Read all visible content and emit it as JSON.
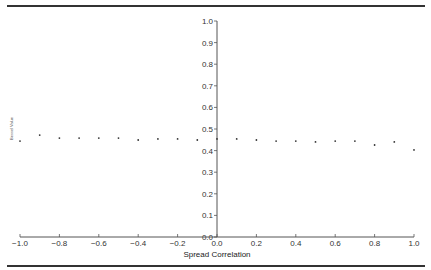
{
  "chart_data": {
    "type": "scatter",
    "title": "",
    "xlabel": "Spread Correlation",
    "ylabel": "Bessel Value",
    "xlim": [
      -1.0,
      1.0
    ],
    "ylim": [
      0.0,
      1.0
    ],
    "xticks": [
      "−1.0",
      "−0.8",
      "−0.6",
      "−0.4",
      "−0.2",
      "0.0",
      "0.2",
      "0.4",
      "0.6",
      "0.8",
      "1.0"
    ],
    "xtick_values": [
      -1.0,
      -0.8,
      -0.6,
      -0.4,
      -0.2,
      0.0,
      0.2,
      0.4,
      0.6,
      0.8,
      1.0
    ],
    "yticks": [
      "0.0",
      "0.1",
      "0.2",
      "0.3",
      "0.4",
      "0.5",
      "0.6",
      "0.7",
      "0.8",
      "0.9",
      "1.0"
    ],
    "ytick_values": [
      0.0,
      0.1,
      0.2,
      0.3,
      0.4,
      0.5,
      0.6,
      0.7,
      0.8,
      0.9,
      1.0
    ],
    "grid": false,
    "legend": null,
    "axes_position": "centered-y-axis-at-x0",
    "series": [
      {
        "name": "Bessel Value",
        "x": [
          -1.0,
          -0.9,
          -0.8,
          -0.7,
          -0.6,
          -0.5,
          -0.4,
          -0.3,
          -0.2,
          -0.1,
          0.0,
          0.1,
          0.2,
          0.3,
          0.4,
          0.5,
          0.6,
          0.7,
          0.8,
          0.9,
          1.0
        ],
        "y": [
          0.444,
          0.472,
          0.458,
          0.458,
          0.458,
          0.458,
          0.449,
          0.454,
          0.454,
          0.449,
          0.454,
          0.454,
          0.449,
          0.444,
          0.444,
          0.44,
          0.444,
          0.444,
          0.426,
          0.44,
          0.403
        ]
      }
    ]
  }
}
